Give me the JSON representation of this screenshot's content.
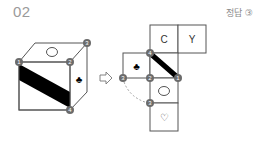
{
  "header": {
    "question_number": "02",
    "answer_label": "정답 ③"
  },
  "cube": {
    "top_face_symbol": "○",
    "right_face_symbol": "♣",
    "front_face": "diagonal black band",
    "vertex_markers": [
      "1",
      "2",
      "3",
      "4"
    ]
  },
  "arrow": "⇨",
  "net": {
    "cells": [
      {
        "symbol": "C"
      },
      {
        "symbol": "Y"
      },
      {
        "symbol": "♣"
      },
      {
        "symbol": "diagonal black band"
      },
      {
        "symbol": "○"
      },
      {
        "symbol": "♡"
      }
    ],
    "vertex_markers": [
      "4",
      "3",
      "2",
      "1",
      "3"
    ]
  },
  "colors": {
    "line": "#555555",
    "marker_fill": "#6b6b6b",
    "marker_text": "#ffffff",
    "band": "#000000",
    "dashed": "#999999"
  }
}
